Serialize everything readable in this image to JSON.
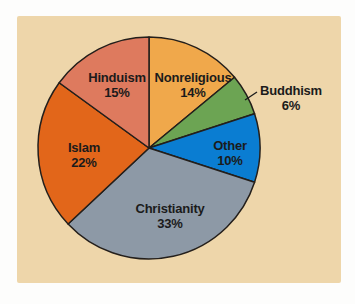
{
  "page": {
    "background": "#fdfdfc",
    "panel_background": "#eed6aa"
  },
  "chart_data": {
    "type": "pie",
    "title": "",
    "unit": "%",
    "start_angle": "top",
    "direction": "clockwise",
    "legend": "none",
    "outline_color": "#241f1b",
    "label_color": "#1b1b1b",
    "pie_center": [
      132,
      132
    ],
    "pie_radius": 111,
    "slices": [
      {
        "label": "Nonreligious",
        "value": 14,
        "color": "#f0a84b",
        "label_at": [
          176,
          61
        ]
      },
      {
        "label": "Buddhism",
        "value": 6,
        "color": "#6ca453",
        "label_at": [
          274,
          74
        ],
        "outside": true,
        "leader": [
          [
            240,
            76
          ],
          [
            228,
            84
          ]
        ]
      },
      {
        "label": "Other",
        "value": 10,
        "color": "#0a7dd2",
        "label_at": [
          213,
          129
        ]
      },
      {
        "label": "Christianity",
        "value": 33,
        "color": "#8d99a6",
        "label_at": [
          153,
          192
        ]
      },
      {
        "label": "Islam",
        "value": 22,
        "color": "#e2661a",
        "label_at": [
          67,
          131
        ]
      },
      {
        "label": "Hinduism",
        "value": 15,
        "color": "#de7a5e",
        "label_at": [
          100,
          61
        ]
      }
    ]
  }
}
